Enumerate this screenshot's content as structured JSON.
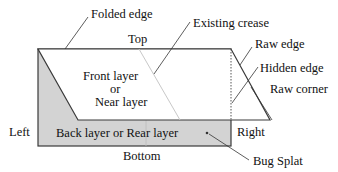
{
  "diagram": {
    "labels": {
      "folded_edge": "Folded edge",
      "existing_crease": "Existing crease",
      "top": "Top",
      "raw_edge": "Raw edge",
      "hidden_edge": "Hidden edge",
      "front_layer_1": "Front layer",
      "front_layer_2": "or",
      "front_layer_3": "Near layer",
      "raw_corner": "Raw corner",
      "left": "Left",
      "back_layer": "Back layer or Rear layer",
      "right": "Right",
      "bottom": "Bottom",
      "bug_splat": "Bug Splat"
    },
    "colors": {
      "back_layer_fill": "#d3d3d3",
      "front_layer_fill": "#ffffff",
      "outline": "#3a3a3a",
      "crease": "#c8c8c8"
    }
  }
}
